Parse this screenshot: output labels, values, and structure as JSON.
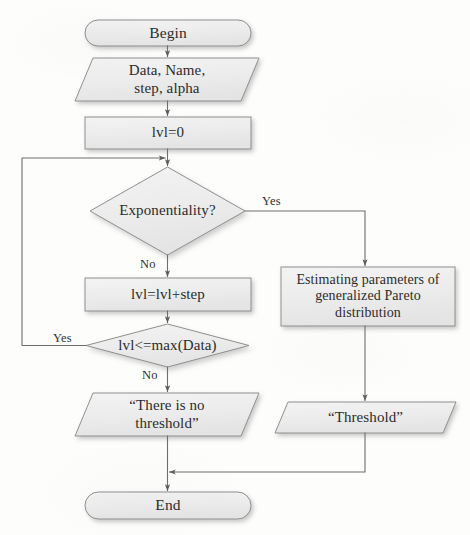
{
  "diagram": {
    "style": {
      "shape_fill": "#ededed",
      "shape_fill_light": "#f2f2f2",
      "shape_stroke": "#8f8f8f",
      "connector_stroke": "#6e6e6e",
      "text_color": "#2c2c2c",
      "background": "#fdfdfc"
    },
    "nodes": [
      {
        "id": "begin",
        "type": "terminator",
        "label": "Begin",
        "x": 85,
        "y": 20,
        "w": 166,
        "h": 26
      },
      {
        "id": "input",
        "type": "input-output",
        "label": "Data, Name,\nstep, alpha",
        "x": 75,
        "y": 58,
        "w": 184,
        "h": 43
      },
      {
        "id": "init",
        "type": "process",
        "label": "lvl=0",
        "x": 85,
        "y": 117,
        "w": 166,
        "h": 32
      },
      {
        "id": "exponentiality",
        "type": "decision",
        "label": "Exponentiality?",
        "x": 90,
        "y": 167,
        "w": 155,
        "h": 88
      },
      {
        "id": "increment",
        "type": "process",
        "label": "lvl=lvl+step",
        "x": 85,
        "y": 278,
        "w": 166,
        "h": 33
      },
      {
        "id": "loop-check",
        "type": "decision",
        "label": "lvl<=max(Data)",
        "x": 86,
        "y": 324,
        "w": 163,
        "h": 43
      },
      {
        "id": "estimate",
        "type": "process",
        "label": "Estimating parameters of\ngeneralized Pareto\ndistribution",
        "x": 281,
        "y": 267,
        "w": 174,
        "h": 59
      },
      {
        "id": "no-threshold",
        "type": "input-output",
        "label": "“There is no\nthreshold”",
        "x": 75,
        "y": 393,
        "w": 184,
        "h": 43
      },
      {
        "id": "threshold-out",
        "type": "input-output",
        "label": "“Threshold”",
        "x": 275,
        "y": 402,
        "w": 181,
        "h": 31
      },
      {
        "id": "end",
        "type": "terminator",
        "label": "End",
        "x": 85,
        "y": 492,
        "w": 166,
        "h": 27
      }
    ],
    "edge_labels": [
      {
        "id": "exp-yes",
        "text": "Yes",
        "x": 262,
        "y": 195
      },
      {
        "id": "exp-no",
        "text": "No",
        "x": 140,
        "y": 258
      },
      {
        "id": "loop-yes",
        "text": "Yes",
        "x": 53,
        "y": 332
      },
      {
        "id": "loop-no",
        "text": "No",
        "x": 142,
        "y": 369
      }
    ],
    "edges": [
      {
        "id": "begin-to-input",
        "from": "begin",
        "to": "input"
      },
      {
        "id": "input-to-init",
        "from": "input",
        "to": "init"
      },
      {
        "id": "init-to-exponentiality",
        "from": "init",
        "to": "exponentiality"
      },
      {
        "id": "exponentiality-yes",
        "from": "exponentiality",
        "to": "estimate",
        "label": "Yes"
      },
      {
        "id": "exponentiality-no",
        "from": "exponentiality",
        "to": "increment",
        "label": "No"
      },
      {
        "id": "increment-to-check",
        "from": "increment",
        "to": "loop-check"
      },
      {
        "id": "check-yes-loopback",
        "from": "loop-check",
        "to": "exponentiality",
        "label": "Yes"
      },
      {
        "id": "check-no",
        "from": "loop-check",
        "to": "no-threshold",
        "label": "No"
      },
      {
        "id": "estimate-to-threshold",
        "from": "estimate",
        "to": "threshold-out"
      },
      {
        "id": "no-threshold-to-end",
        "from": "no-threshold",
        "to": "end"
      },
      {
        "id": "threshold-to-end",
        "from": "threshold-out",
        "to": "end"
      }
    ]
  }
}
